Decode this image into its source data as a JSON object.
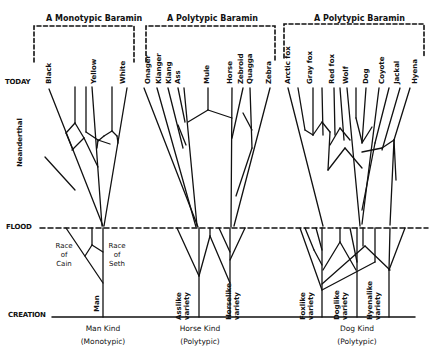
{
  "baramins": [
    {
      "title": "A Monotypic Baramin"
    },
    {
      "title": "A Polytypic Baramin"
    },
    {
      "title": "A Polytypic Baramin"
    }
  ],
  "eras": {
    "today": "TODAY",
    "flood": "FLOOD",
    "creation": "CREATION"
  },
  "man": {
    "today": [
      "Black",
      "Yellow",
      "White"
    ],
    "extinct": "Neanderthal",
    "race_cain": [
      "Race",
      "of",
      "Cain"
    ],
    "race_seth": [
      "Race",
      "of",
      "Seth"
    ],
    "root": "Man",
    "kind": "Man Kind",
    "kind_type": "(Monotypic)"
  },
  "horse": {
    "today": [
      "Onager",
      "Kianger",
      "Kiang",
      "Ass",
      "Mule",
      "Horse",
      "Zebroid",
      "Quagga",
      "Zebra"
    ],
    "varieties": [
      "Asslike variety",
      "Horselike variety"
    ],
    "variety_lines": [
      [
        "Asslike",
        "variety"
      ],
      [
        "Horselike",
        "variety"
      ]
    ],
    "kind": "Horse Kind",
    "kind_type": "(Polytypic)"
  },
  "dog": {
    "today": [
      "Arctic fox",
      "Gray fox",
      "Red fox",
      "Wolf",
      "Dog",
      "Coyote",
      "Jackal",
      "Hyena"
    ],
    "variety_lines": [
      [
        "Foxlike",
        "variety"
      ],
      [
        "Doglike",
        "variety"
      ],
      [
        "Hyenalike",
        "variety"
      ]
    ],
    "kind": "Dog Kind",
    "kind_type": "(Polytypic)"
  },
  "colors": {
    "ink": "#111111",
    "background": "#ffffff"
  }
}
